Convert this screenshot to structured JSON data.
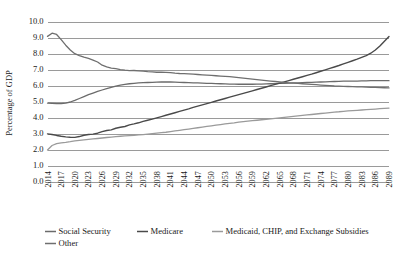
{
  "chart_data": {
    "type": "line",
    "title": "",
    "xlabel": "",
    "ylabel": "Percentage of GDP",
    "ylim": [
      0.0,
      10.0
    ],
    "ytick_step": 1.0,
    "ytick_labels": [
      "0.0",
      "1.0",
      "2.0",
      "3.0",
      "4.0",
      "5.0",
      "6.0",
      "7.0",
      "8.0",
      "9.0",
      "10.0"
    ],
    "xlim": [
      2014,
      2089
    ],
    "xtick_step": 3,
    "xtick_labels": [
      "2014",
      "2017",
      "2020",
      "2023",
      "2026",
      "2029",
      "2032",
      "2035",
      "2038",
      "2041",
      "2044",
      "2047",
      "2050",
      "2053",
      "2056",
      "2059",
      "2062",
      "2065",
      "2068",
      "2071",
      "2074",
      "2077",
      "2080",
      "2083",
      "2086",
      "2089"
    ],
    "grid": "horizontal",
    "legend_position": "bottom-left",
    "x": [
      2014,
      2015,
      2016,
      2017,
      2018,
      2019,
      2020,
      2021,
      2022,
      2023,
      2024,
      2025,
      2026,
      2027,
      2028,
      2029,
      2030,
      2031,
      2032,
      2033,
      2034,
      2035,
      2036,
      2037,
      2038,
      2039,
      2040,
      2041,
      2042,
      2043,
      2044,
      2045,
      2046,
      2047,
      2048,
      2049,
      2050,
      2051,
      2052,
      2053,
      2054,
      2055,
      2056,
      2057,
      2058,
      2059,
      2060,
      2061,
      2062,
      2063,
      2064,
      2065,
      2066,
      2067,
      2068,
      2069,
      2070,
      2071,
      2072,
      2073,
      2074,
      2075,
      2076,
      2077,
      2078,
      2079,
      2080,
      2081,
      2082,
      2083,
      2084,
      2085,
      2086,
      2087,
      2088,
      2089
    ],
    "series": [
      {
        "name": "Social Security",
        "color": "#6b6b6b",
        "width": 1.3,
        "values": [
          4.93,
          4.92,
          4.9,
          4.9,
          4.93,
          5.0,
          5.1,
          5.22,
          5.34,
          5.46,
          5.56,
          5.66,
          5.75,
          5.84,
          5.92,
          5.99,
          6.05,
          6.1,
          6.14,
          6.17,
          6.19,
          6.21,
          6.22,
          6.23,
          6.24,
          6.25,
          6.25,
          6.25,
          6.24,
          6.23,
          6.22,
          6.21,
          6.2,
          6.19,
          6.18,
          6.17,
          6.16,
          6.15,
          6.14,
          6.13,
          6.12,
          6.12,
          6.11,
          6.11,
          6.11,
          6.11,
          6.12,
          6.12,
          6.13,
          6.14,
          6.15,
          6.16,
          6.17,
          6.18,
          6.19,
          6.2,
          6.21,
          6.22,
          6.23,
          6.24,
          6.25,
          6.26,
          6.27,
          6.28,
          6.29,
          6.3,
          6.3,
          6.31,
          6.31,
          6.32,
          6.32,
          6.33,
          6.33,
          6.33,
          6.33,
          6.33
        ]
      },
      {
        "name": "Medicare",
        "color": "#4a4a4a",
        "width": 1.4,
        "values": [
          3.01,
          2.97,
          2.91,
          2.86,
          2.82,
          2.8,
          2.79,
          2.84,
          2.92,
          2.97,
          2.99,
          3.05,
          3.15,
          3.22,
          3.26,
          3.36,
          3.42,
          3.47,
          3.57,
          3.63,
          3.7,
          3.79,
          3.86,
          3.93,
          4.01,
          4.09,
          4.17,
          4.25,
          4.33,
          4.41,
          4.49,
          4.57,
          4.66,
          4.74,
          4.82,
          4.9,
          4.98,
          5.06,
          5.14,
          5.22,
          5.3,
          5.38,
          5.46,
          5.54,
          5.62,
          5.7,
          5.78,
          5.86,
          5.94,
          6.02,
          6.1,
          6.18,
          6.26,
          6.34,
          6.42,
          6.5,
          6.58,
          6.66,
          6.74,
          6.83,
          6.92,
          7.01,
          7.1,
          7.19,
          7.28,
          7.38,
          7.48,
          7.58,
          7.68,
          7.79,
          7.9,
          8.05,
          8.25,
          8.5,
          8.8,
          9.1
        ]
      },
      {
        "name": "Medicaid, CHIP, and Exchange Subsidies",
        "color": "#9a9a9a",
        "width": 1.3,
        "values": [
          2.0,
          2.28,
          2.4,
          2.45,
          2.48,
          2.52,
          2.57,
          2.6,
          2.63,
          2.66,
          2.69,
          2.72,
          2.75,
          2.78,
          2.81,
          2.84,
          2.86,
          2.88,
          2.9,
          2.92,
          2.94,
          2.96,
          2.99,
          3.02,
          3.05,
          3.08,
          3.11,
          3.15,
          3.19,
          3.23,
          3.27,
          3.31,
          3.35,
          3.39,
          3.43,
          3.47,
          3.51,
          3.55,
          3.59,
          3.63,
          3.67,
          3.7,
          3.74,
          3.77,
          3.8,
          3.83,
          3.86,
          3.89,
          3.92,
          3.95,
          3.98,
          4.01,
          4.04,
          4.07,
          4.1,
          4.13,
          4.16,
          4.19,
          4.22,
          4.25,
          4.28,
          4.31,
          4.34,
          4.37,
          4.39,
          4.42,
          4.44,
          4.46,
          4.48,
          4.5,
          4.52,
          4.54,
          4.56,
          4.58,
          4.6,
          4.62
        ]
      },
      {
        "name": "Other",
        "color": "#6f6f6f",
        "width": 1.3,
        "values": [
          9.1,
          9.3,
          9.22,
          8.9,
          8.55,
          8.25,
          8.02,
          7.9,
          7.8,
          7.72,
          7.62,
          7.5,
          7.3,
          7.2,
          7.12,
          7.08,
          7.03,
          6.99,
          6.96,
          6.97,
          6.95,
          6.93,
          6.9,
          6.88,
          6.86,
          6.87,
          6.85,
          6.83,
          6.8,
          6.78,
          6.77,
          6.76,
          6.74,
          6.72,
          6.7,
          6.68,
          6.66,
          6.64,
          6.62,
          6.6,
          6.58,
          6.55,
          6.52,
          6.49,
          6.46,
          6.43,
          6.4,
          6.37,
          6.34,
          6.31,
          6.28,
          6.25,
          6.22,
          6.2,
          6.18,
          6.16,
          6.14,
          6.12,
          6.1,
          6.08,
          6.06,
          6.04,
          6.02,
          6.0,
          5.99,
          5.98,
          5.97,
          5.96,
          5.95,
          5.94,
          5.93,
          5.92,
          5.91,
          5.9,
          5.89,
          5.88
        ]
      }
    ]
  },
  "legend": {
    "items": [
      {
        "label": "Social Security"
      },
      {
        "label": "Medicare"
      },
      {
        "label": "Medicaid, CHIP, and Exchange Subsidies"
      },
      {
        "label": "Other"
      }
    ]
  }
}
